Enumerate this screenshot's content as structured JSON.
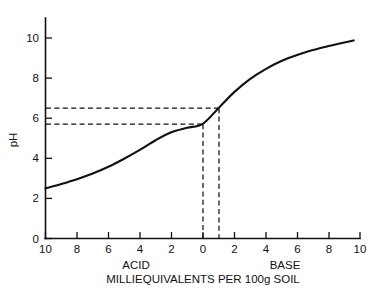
{
  "chart_data": {
    "type": "line",
    "title": "",
    "xlabel": "MILLIEQUIVALENTS PER 100g SOIL",
    "ylabel": "pH",
    "grid": false,
    "legend": "none",
    "x_axis": {
      "tick_labels": [
        "10",
        "8",
        "6",
        "4",
        "2",
        "0",
        "2",
        "4",
        "6",
        "8",
        "10"
      ],
      "tick_values": [
        -10,
        -8,
        -6,
        -4,
        -2,
        0,
        2,
        4,
        6,
        8,
        10
      ],
      "xlim": [
        -10,
        10
      ],
      "note_left": "ACID",
      "note_right": "BASE"
    },
    "y_axis": {
      "tick_labels": [
        "0",
        "2",
        "4",
        "6",
        "8",
        "10"
      ],
      "tick_values": [
        0,
        2,
        4,
        6,
        8,
        10
      ],
      "ylim": [
        0,
        10.8
      ]
    },
    "series": [
      {
        "name": "soil pH titration curve",
        "x": [
          -10,
          -9,
          -8,
          -7,
          -6,
          -5,
          -4,
          -3,
          -2,
          -1,
          0,
          1,
          2,
          3,
          4,
          5,
          6,
          7,
          8,
          9,
          9.6
        ],
        "values": [
          2.5,
          2.72,
          2.96,
          3.24,
          3.58,
          3.98,
          4.42,
          4.9,
          5.3,
          5.52,
          5.72,
          6.5,
          7.3,
          7.95,
          8.45,
          8.85,
          9.15,
          9.4,
          9.6,
          9.78,
          9.88
        ]
      }
    ],
    "annotations": [
      {
        "name": "upper-reading",
        "ph": 6.5,
        "meq": 1,
        "label": "pH 6.5 at 1 meq base"
      },
      {
        "name": "lower-reading",
        "ph": 5.7,
        "meq": 0,
        "label": "pH 5.7 at 0 meq"
      }
    ]
  },
  "labels": {
    "y_axis_title": "pH",
    "x_axis_title": "MILLIEQUIVALENTS PER 100g SOIL",
    "acid": "ACID",
    "base": "BASE",
    "y_ticks": [
      "0",
      "2",
      "4",
      "6",
      "8",
      "10"
    ],
    "x_ticks": [
      "10",
      "8",
      "6",
      "4",
      "2",
      "0",
      "2",
      "4",
      "6",
      "8",
      "10"
    ]
  },
  "colors": {
    "ink": "#111111",
    "background": "#ffffff"
  }
}
